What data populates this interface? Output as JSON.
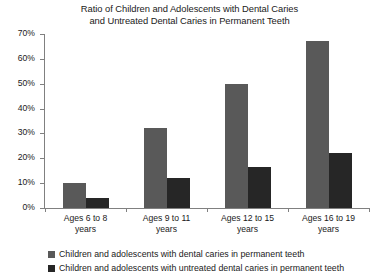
{
  "chart_data": {
    "type": "bar",
    "title": "Ratio of Children and Adolescents with Dental Caries and Untreated Dental Caries in Permanent Teeth",
    "title_lines": [
      "Ratio of Children and Adolescents with Dental Caries",
      "and Untreated Dental Caries in Permanent Teeth"
    ],
    "xlabel": "",
    "ylabel": "",
    "ylim": [
      0,
      70
    ],
    "ytick_values": [
      0,
      10,
      20,
      30,
      40,
      50,
      60,
      70
    ],
    "ytick_labels": [
      "0%",
      "10%",
      "20%",
      "30%",
      "40%",
      "50%",
      "60%",
      "70%"
    ],
    "grid": false,
    "legend_position": "bottom-left",
    "categories": [
      "Ages 6 to 8 years",
      "Ages 9 to 11 years",
      "Ages 12 to 15 years",
      "Ages 16 to 19 years"
    ],
    "category_lines": [
      [
        "Ages 6 to 8",
        "years"
      ],
      [
        "Ages 9 to 11",
        "years"
      ],
      [
        "Ages 12 to 15",
        "years"
      ],
      [
        "Ages 16 to 19",
        "years"
      ]
    ],
    "series": [
      {
        "name": "Children and adolescents with dental caries in permanent teeth",
        "color": "#595959",
        "values": [
          10,
          32,
          50,
          67
        ]
      },
      {
        "name": "Children and adolescents with untreated dental caries in permanent teeth",
        "color": "#262626",
        "values": [
          4,
          12,
          16.5,
          22
        ]
      }
    ]
  }
}
